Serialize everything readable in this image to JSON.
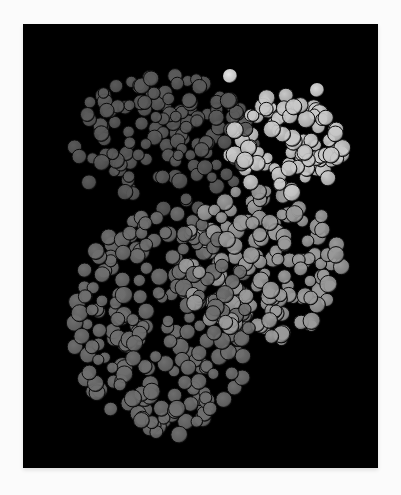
{
  "figure": {
    "caption": "",
    "background_color": "#000000",
    "page_color": "#fbfbfb",
    "domains": [
      {
        "name": "upper-left domain",
        "shade": "#5a5a5a",
        "cx": 140,
        "cy": 120,
        "rx": 95,
        "ry": 70,
        "count": 140,
        "r": 6.5
      },
      {
        "name": "upper-right domain",
        "shade": "#c8c8c8",
        "cx": 265,
        "cy": 120,
        "rx": 60,
        "ry": 50,
        "count": 90,
        "r": 7
      },
      {
        "name": "middle-right domain",
        "shade": "#9a9a9a",
        "cx": 240,
        "cy": 240,
        "rx": 80,
        "ry": 80,
        "count": 150,
        "r": 7
      },
      {
        "name": "lower-left domain",
        "shade": "#6e6e6e",
        "cx": 140,
        "cy": 300,
        "rx": 90,
        "ry": 115,
        "count": 230,
        "r": 7
      }
    ],
    "highlights": [
      {
        "name": "bright-atom-top",
        "shade": "#e6e6e6",
        "cx": 207,
        "cy": 52,
        "r": 7
      },
      {
        "name": "bright-atom-upper-right",
        "shade": "#d8d8d8",
        "cx": 294,
        "cy": 66,
        "r": 7
      }
    ]
  }
}
